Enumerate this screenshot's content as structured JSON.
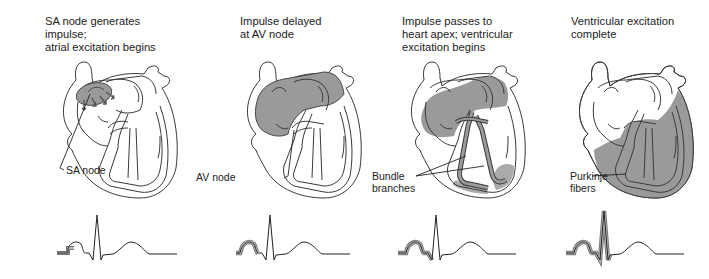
{
  "colors": {
    "stroke": "#3a3a3a",
    "shade": "#9a9a9a",
    "shade_light": "#b5b5b5",
    "background": "#ffffff",
    "text": "#222222"
  },
  "panels": [
    {
      "title": "SA node generates impulse;\natrial excitation begins",
      "label": "SA node",
      "excited_region": "sa-node",
      "ecg_highlight": "p-wave-start"
    },
    {
      "title": "Impulse delayed\nat AV node",
      "label": "AV node",
      "excited_region": "atria",
      "ecg_highlight": "p-wave"
    },
    {
      "title": "Impulse passes to\nheart apex; ventricular\nexcitation begins",
      "label": "Bundle\nbranches",
      "excited_region": "atria-bundle-branches",
      "ecg_highlight": "p-wave-pr-q"
    },
    {
      "title": "Ventricular excitation\ncomplete",
      "label": "Purkinje\nfibers",
      "excited_region": "ventricles",
      "ecg_highlight": "p-wave-qrs"
    }
  ]
}
